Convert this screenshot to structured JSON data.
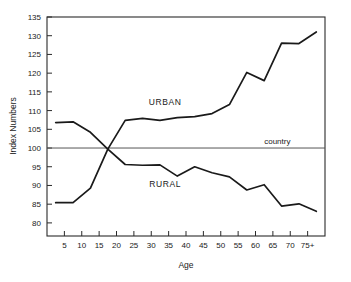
{
  "chart_data": {
    "type": "line",
    "title": "",
    "xlabel": "Age",
    "ylabel": "Index Numbers",
    "xlim": [
      0,
      80
    ],
    "ylim": [
      76.5,
      135
    ],
    "grid": false,
    "legend": "inline-annotations",
    "x_tick_labels": [
      "5",
      "10",
      "15",
      "20",
      "25",
      "30",
      "35",
      "40",
      "45",
      "50",
      "55",
      "60",
      "65",
      "70",
      "75+"
    ],
    "x_tick_values": [
      5,
      10,
      15,
      20,
      25,
      30,
      35,
      40,
      45,
      50,
      55,
      60,
      65,
      70,
      75
    ],
    "y_tick_labels": [
      "80",
      "85",
      "90",
      "95",
      "100",
      "105",
      "110",
      "115",
      "120",
      "125",
      "130",
      "135"
    ],
    "y_tick_values": [
      80,
      85,
      90,
      95,
      100,
      105,
      110,
      115,
      120,
      125,
      130,
      135
    ],
    "x": [
      2.5,
      7.5,
      12.5,
      17.5,
      22.5,
      27.5,
      32.5,
      37.5,
      42.5,
      47.5,
      52.5,
      57.5,
      62.5,
      67.5,
      72.5,
      77.5
    ],
    "series": [
      {
        "name": "URBAN",
        "label_x": 34,
        "label_y": 111.5,
        "values": [
          85.4,
          85.4,
          89.3,
          99.7,
          107.4,
          107.9,
          107.4,
          108.1,
          108.4,
          109.2,
          111.6,
          120.2,
          118.0,
          128.0,
          127.9,
          131.0
        ]
      },
      {
        "name": "RURAL",
        "label_x": 34,
        "label_y": 89.6,
        "values": [
          106.8,
          107.0,
          104.2,
          99.7,
          95.6,
          95.4,
          95.5,
          92.5,
          95.0,
          93.4,
          92.3,
          88.8,
          90.2,
          84.5,
          85.1,
          83.1
        ]
      }
    ],
    "reference_line": {
      "label": "country",
      "value": 100,
      "label_x": 62.5,
      "label_y": 100
    }
  },
  "axes": {
    "x_axis_name": "Age",
    "y_axis_name": "Index Numbers"
  },
  "marks": {
    "top_right_smudge": ""
  }
}
